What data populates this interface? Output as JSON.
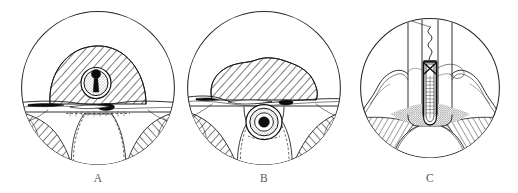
{
  "figure": {
    "kind": "anatomical-line-drawing",
    "background_color": "#ffffff",
    "ink_color": "#1a1a1a",
    "caption_color": "#5a5a58",
    "width": 518,
    "height": 193,
    "panel_count": 3
  },
  "panels": [
    {
      "id": "panel-a",
      "caption": "A",
      "caption_x": 98,
      "caption_y": 182,
      "center_x": 98,
      "center_y": 88,
      "radius": 77,
      "description": "Circular vignette: hatched dome of tissue above a horizontal membrane, with a small round duct containing a dark core at the dome center; splayed hatched flanks below."
    },
    {
      "id": "panel-b",
      "caption": "B",
      "caption_x": 264,
      "caption_y": 182,
      "center_x": 264,
      "center_y": 88,
      "radius": 77,
      "description": "Circular vignette: hatched mass resting above the horizontal membrane, with the round duct and dark core now displaced below the membrane line, flanked by hatched wedges."
    },
    {
      "id": "panel-c",
      "caption": "C",
      "caption_x": 430,
      "caption_y": 182,
      "center_x": 430,
      "center_y": 88,
      "radius": 70,
      "description": "Circular vignette: two vertical tubular columns converging on a narrow ladder-like instrument with a cross-hatched tip and a coiled thread leading up to the left; stippled base with hatched floor below."
    }
  ],
  "captions": {
    "a": "A",
    "b": "B",
    "c": "C"
  }
}
